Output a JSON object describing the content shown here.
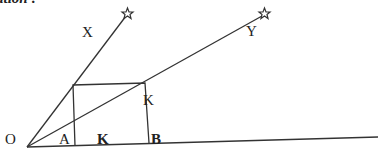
{
  "caption_fragment": "ation :",
  "labels": {
    "vertex": "O",
    "ray_upper": "X",
    "ray_lower": "Y",
    "square_bottom_left": "A",
    "square_bottom_right": "B",
    "square_top_right_side": "K",
    "square_side_bottom": "K"
  },
  "geometry": {
    "vertex": [
      27,
      147
    ],
    "ray_x_end": [
      127,
      13
    ],
    "ray_y_end": [
      264,
      13
    ],
    "baseline_end": [
      378,
      137
    ],
    "square": {
      "top_left": [
        73,
        85
      ],
      "top_right": [
        145,
        83
      ],
      "bottom_right": [
        149,
        143
      ],
      "bottom_left": [
        75,
        146
      ]
    }
  },
  "colors": {
    "stroke": "#333333",
    "text": "#222222",
    "background": "#ffffff"
  }
}
